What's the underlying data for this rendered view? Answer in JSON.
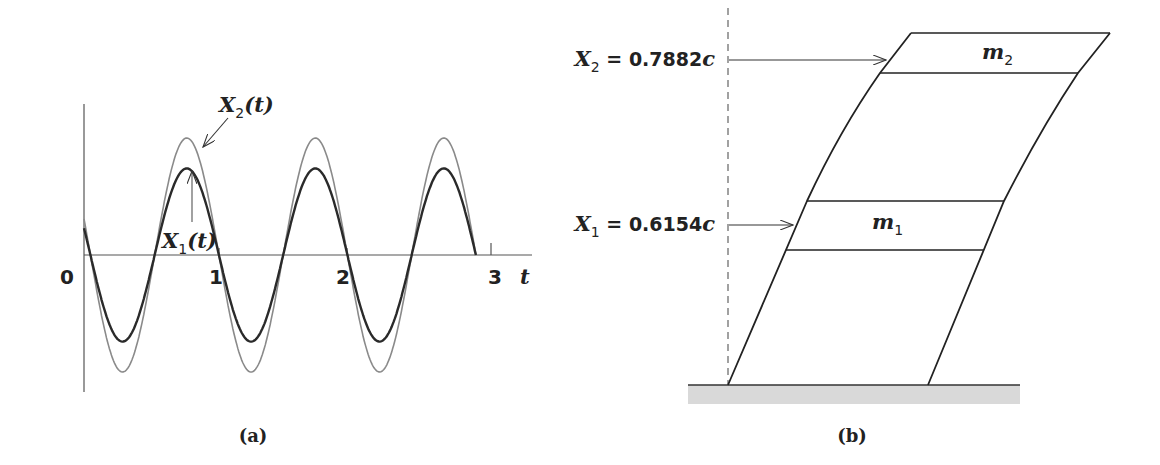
{
  "panel_a": {
    "caption": "(a)",
    "origin_label": "0",
    "x_ticks": [
      "1",
      "2",
      "3"
    ],
    "x_axis_label": "t",
    "curve_x2": {
      "label_main": "X",
      "label_sub": "2",
      "label_arg": "(t)",
      "color": "#8a8a8a"
    },
    "curve_x1": {
      "label_main": "X",
      "label_sub": "1",
      "label_arg": "(t)",
      "color": "#2a2a2a"
    }
  },
  "panel_b": {
    "caption": "(b)",
    "mass_top": {
      "main": "m",
      "sub": "2"
    },
    "mass_bottom": {
      "main": "m",
      "sub": "1"
    },
    "x2_label": {
      "main": "X",
      "sub": "2",
      "value": " = 0.7882",
      "unit": "c"
    },
    "x1_label": {
      "main": "X",
      "sub": "1",
      "value": " = 0.6154",
      "unit": "c"
    },
    "ground_color": "#d9d9d9"
  },
  "chart_data": {
    "type": "line",
    "title": "",
    "xlabel": "t",
    "ylabel": "",
    "x_ticks": [
      0,
      1,
      2,
      3
    ],
    "xlim": [
      0,
      3.05
    ],
    "grid": false,
    "series": [
      {
        "name": "X2(t)",
        "amplitude_relative": 1.0,
        "peaks_t": [
          0.8,
          1.8,
          2.8
        ],
        "troughs_t": [
          0.3,
          1.3,
          2.3
        ],
        "color": "#8a8a8a"
      },
      {
        "name": "X1(t)",
        "amplitude_relative": 0.74,
        "peaks_t": [
          0.8,
          1.8,
          2.8
        ],
        "troughs_t": [
          0.3,
          1.3,
          2.3
        ],
        "initial_value_relative": 0.47,
        "color": "#2a2a2a"
      }
    ],
    "annotations": [
      "X2(t)",
      "X1(t)"
    ]
  }
}
